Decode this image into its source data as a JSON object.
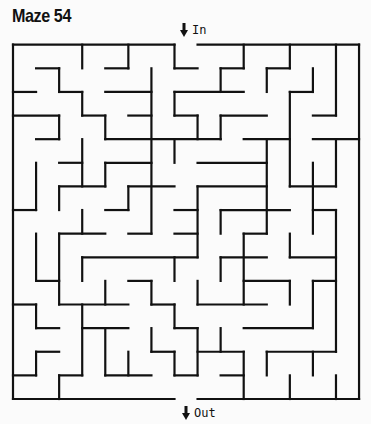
{
  "title": "Maze 54",
  "entrance": {
    "label": "In",
    "icon": "down-arrow-icon",
    "column": 7
  },
  "exit": {
    "label": "Out",
    "icon": "down-arrow-icon",
    "column": 7
  },
  "maze": {
    "columns": 15,
    "rows": 15,
    "origin_px": [
      13,
      44.7
    ],
    "cell_px": [
      23.07,
      23.62
    ],
    "wall_color": "#111111",
    "wall_width": 2.2,
    "walls": [
      [
        0,
        0,
        7,
        0
      ],
      [
        8,
        0,
        15,
        0
      ],
      [
        0,
        0,
        0,
        15
      ],
      [
        15,
        0,
        15,
        15
      ],
      [
        0,
        15,
        7,
        15
      ],
      [
        8,
        15,
        15,
        15
      ],
      [
        3,
        0,
        3,
        1
      ],
      [
        5,
        0,
        5,
        1
      ],
      [
        4,
        1,
        5,
        1
      ],
      [
        7,
        0,
        7,
        1
      ],
      [
        7,
        1,
        8,
        1
      ],
      [
        10,
        0,
        10,
        1
      ],
      [
        9,
        1,
        10,
        1
      ],
      [
        9,
        1,
        9,
        2
      ],
      [
        12,
        0,
        12,
        1
      ],
      [
        11,
        1,
        12,
        1
      ],
      [
        11,
        1,
        11,
        2
      ],
      [
        14,
        0,
        14,
        3
      ],
      [
        13,
        3,
        14,
        3
      ],
      [
        13,
        1,
        13,
        2
      ],
      [
        12,
        2,
        13,
        2
      ],
      [
        12,
        2,
        12,
        6
      ],
      [
        1,
        1,
        2,
        1
      ],
      [
        2,
        1,
        2,
        2
      ],
      [
        2,
        2,
        3,
        2
      ],
      [
        3,
        2,
        3,
        3
      ],
      [
        3,
        3,
        4,
        3
      ],
      [
        4,
        3,
        4,
        4
      ],
      [
        4,
        4,
        9,
        4
      ],
      [
        0,
        2,
        1,
        2
      ],
      [
        6,
        1,
        6,
        8
      ],
      [
        5,
        8,
        6,
        8
      ],
      [
        5,
        6,
        7,
        6
      ],
      [
        4,
        2,
        6,
        2
      ],
      [
        5,
        3,
        6,
        3
      ],
      [
        7,
        2,
        10,
        2
      ],
      [
        7,
        2,
        7,
        3
      ],
      [
        7,
        3,
        8,
        3
      ],
      [
        8,
        3,
        8,
        4
      ],
      [
        9,
        3,
        11,
        3
      ],
      [
        9,
        3,
        9,
        4
      ],
      [
        0,
        3,
        2,
        3
      ],
      [
        2,
        3,
        2,
        4
      ],
      [
        1,
        4,
        2,
        4
      ],
      [
        10,
        4,
        12,
        4
      ],
      [
        11,
        4,
        11,
        8
      ],
      [
        13,
        4,
        15,
        4
      ],
      [
        14,
        4,
        14,
        6
      ],
      [
        12,
        6,
        14,
        6
      ],
      [
        3,
        4,
        3,
        6
      ],
      [
        2,
        5,
        3,
        5
      ],
      [
        7,
        4,
        7,
        5
      ],
      [
        4,
        5,
        6,
        5
      ],
      [
        4,
        5,
        4,
        6
      ],
      [
        2,
        6,
        4,
        6
      ],
      [
        2,
        6,
        2,
        7
      ],
      [
        8,
        5,
        11,
        5
      ],
      [
        8,
        6,
        11,
        6
      ],
      [
        8,
        6,
        8,
        9
      ],
      [
        1,
        5,
        1,
        7
      ],
      [
        0,
        7,
        1,
        7
      ],
      [
        13,
        5,
        13,
        8
      ],
      [
        13,
        7,
        14,
        7
      ],
      [
        14,
        7,
        14,
        13
      ],
      [
        5,
        6,
        5,
        7
      ],
      [
        4,
        7,
        5,
        7
      ],
      [
        7,
        7,
        8,
        7
      ],
      [
        9,
        7,
        12,
        7
      ],
      [
        9,
        7,
        9,
        8
      ],
      [
        3,
        7,
        3,
        8
      ],
      [
        2,
        8,
        4,
        8
      ],
      [
        2,
        8,
        2,
        11
      ],
      [
        7,
        8,
        8,
        8
      ],
      [
        10,
        8,
        11,
        8
      ],
      [
        10,
        8,
        10,
        11
      ],
      [
        1,
        8,
        1,
        10
      ],
      [
        1,
        10,
        2,
        10
      ],
      [
        3,
        9,
        8,
        9
      ],
      [
        3,
        9,
        3,
        10
      ],
      [
        12,
        8,
        12,
        9
      ],
      [
        12,
        9,
        14,
        9
      ],
      [
        9,
        9,
        11,
        9
      ],
      [
        9,
        9,
        9,
        10
      ],
      [
        7,
        9,
        7,
        10
      ],
      [
        10,
        10,
        12,
        10
      ],
      [
        12,
        10,
        12,
        11
      ],
      [
        13,
        10,
        14,
        10
      ],
      [
        13,
        10,
        13,
        12
      ],
      [
        4,
        10,
        4,
        11
      ],
      [
        2,
        11,
        5,
        11
      ],
      [
        5,
        10,
        6,
        10
      ],
      [
        6,
        10,
        6,
        11
      ],
      [
        6,
        11,
        7,
        11
      ],
      [
        7,
        11,
        7,
        12
      ],
      [
        7,
        12,
        8,
        12
      ],
      [
        8,
        10,
        8,
        11
      ],
      [
        8,
        11,
        11,
        11
      ],
      [
        0,
        11,
        1,
        11
      ],
      [
        1,
        11,
        1,
        12
      ],
      [
        1,
        12,
        2,
        12
      ],
      [
        3,
        11,
        3,
        14
      ],
      [
        2,
        14,
        3,
        14
      ],
      [
        3,
        12,
        5,
        12
      ],
      [
        4,
        12,
        4,
        14
      ],
      [
        4,
        14,
        6,
        14
      ],
      [
        5,
        13,
        5,
        14
      ],
      [
        6,
        12,
        6,
        13
      ],
      [
        6,
        13,
        7,
        13
      ],
      [
        7,
        13,
        7,
        14
      ],
      [
        7,
        14,
        8,
        14
      ],
      [
        8,
        12,
        8,
        14
      ],
      [
        9,
        12,
        9,
        13
      ],
      [
        8,
        13,
        10,
        13
      ],
      [
        10,
        13,
        10,
        15
      ],
      [
        10,
        12,
        13,
        12
      ],
      [
        9,
        14,
        10,
        14
      ],
      [
        11,
        13,
        14,
        13
      ],
      [
        11,
        13,
        11,
        14
      ],
      [
        13,
        13,
        13,
        14
      ],
      [
        12,
        14,
        12,
        15
      ],
      [
        14,
        14,
        14,
        15
      ],
      [
        1,
        13,
        2,
        13
      ],
      [
        1,
        13,
        1,
        14
      ],
      [
        0,
        14,
        1,
        14
      ],
      [
        2,
        14,
        2,
        15
      ]
    ]
  }
}
